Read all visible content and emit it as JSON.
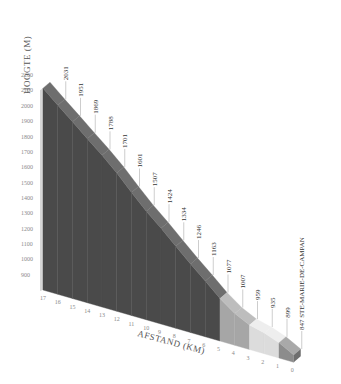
{
  "chart_data": {
    "type": "area",
    "title": "",
    "xlabel": "AFSTAND (KM)",
    "ylabel": "HOOGTE (M)",
    "ylim": [
      800,
      2200
    ],
    "y_ticks": [
      900,
      1000,
      1100,
      1200,
      1300,
      1400,
      1500,
      1600,
      1700,
      1800,
      1900,
      2000,
      2100,
      2200
    ],
    "x_ticks": [
      17,
      16,
      15,
      14,
      13,
      12,
      11,
      10,
      9,
      8,
      7,
      6,
      5,
      4,
      3,
      2,
      1,
      0
    ],
    "x": [
      17,
      16,
      15,
      14,
      13,
      12,
      11,
      10,
      9,
      8,
      7,
      6,
      5,
      4,
      3,
      2,
      1,
      0
    ],
    "elevation": [
      2115,
      2031,
      1951,
      1869,
      1788,
      1701,
      1601,
      1507,
      1424,
      1334,
      1246,
      1163,
      1077,
      1007,
      959,
      935,
      899,
      847
    ],
    "point_labels": [
      {
        "km": 16,
        "label": "2031"
      },
      {
        "km": 15,
        "label": "1951"
      },
      {
        "km": 14,
        "label": "1869"
      },
      {
        "km": 13,
        "label": "1788"
      },
      {
        "km": 12,
        "label": "1701"
      },
      {
        "km": 11,
        "label": "1601"
      },
      {
        "km": 10,
        "label": "1507"
      },
      {
        "km": 9,
        "label": "1424"
      },
      {
        "km": 8,
        "label": "1334"
      },
      {
        "km": 7,
        "label": "1246"
      },
      {
        "km": 6,
        "label": "1163"
      },
      {
        "km": 5,
        "label": "1077"
      },
      {
        "km": 4,
        "label": "1007"
      },
      {
        "km": 3,
        "label": "959"
      },
      {
        "km": 2,
        "label": "935"
      },
      {
        "km": 1,
        "label": "899"
      },
      {
        "km": 0,
        "label": "847 STE-MARIE-DE-CAMPAN"
      }
    ],
    "segments": [
      {
        "from_km": 17,
        "to_km": 5,
        "color": "#4a4a4a",
        "top_color": "#6e6e6e"
      },
      {
        "from_km": 5,
        "to_km": 3,
        "color": "#a6a6a6",
        "top_color": "#bdbdbd"
      },
      {
        "from_km": 3,
        "to_km": 1,
        "color": "#dcdcdc",
        "top_color": "#eeeeee"
      },
      {
        "from_km": 1,
        "to_km": 0,
        "color": "#8c8c8c",
        "top_color": "#a9a9a9"
      }
    ],
    "grid": false,
    "legend": "none",
    "projection": "3d-oblique"
  }
}
